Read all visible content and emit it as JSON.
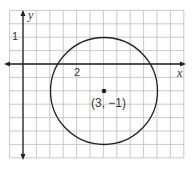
{
  "chart_data": {
    "type": "scatter",
    "title": "",
    "xlabel": "x",
    "ylabel": "y",
    "grid": true,
    "xlim": [
      -0.5,
      6
    ],
    "ylim": [
      -3.5,
      2
    ],
    "tick_labels": {
      "x": [
        "2"
      ],
      "y": [
        "1"
      ]
    },
    "shapes": [
      {
        "type": "circle",
        "center": [
          3,
          -1
        ],
        "radius": 2
      }
    ],
    "points": [
      {
        "x": 3,
        "y": -1,
        "label": "(3, −1)"
      }
    ]
  },
  "labels": {
    "x_axis": "x",
    "y_axis": "y",
    "x_tick": "2",
    "y_tick": "1",
    "center": "(3, −1)"
  }
}
